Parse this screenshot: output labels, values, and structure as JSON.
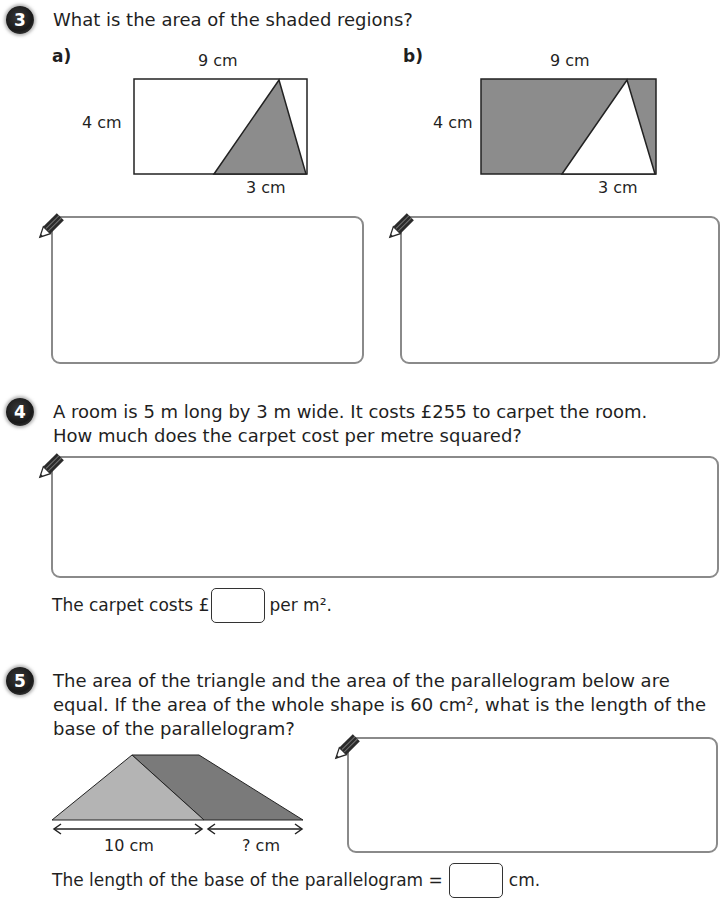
{
  "questions": [
    {
      "number": "3",
      "text": "What is the area of the shaded regions?",
      "parts": [
        {
          "label": "a)",
          "top_dim": "9 cm",
          "side_dim": "4 cm",
          "bottom_dim": "3 cm"
        },
        {
          "label": "b)",
          "top_dim": "9 cm",
          "side_dim": "4 cm",
          "bottom_dim": "3 cm"
        }
      ]
    },
    {
      "number": "4",
      "text_line1": "A room is 5 m long by 3 m wide. It costs £255 to carpet the room.",
      "text_line2": "How much does the carpet cost per metre squared?",
      "answer_prefix": "The carpet costs £",
      "answer_suffix": "per m².",
      "answer_value": ""
    },
    {
      "number": "5",
      "text_line1": "The area of the triangle and the area of the parallelogram below are",
      "text_line2": "equal. If the area of the whole shape is 60 cm², what is the length of the",
      "text_line3": "base of the parallelogram?",
      "triangle_base": "10 cm",
      "parallelogram_base": "? cm",
      "answer_prefix": "The length of the base of the parallelogram =",
      "answer_suffix": "cm.",
      "answer_value": ""
    }
  ],
  "colors": {
    "shade_dark": "#8c8c8c",
    "shade_light": "#b4b4b4",
    "shade_darker": "#7a7a7a",
    "box_border": "#8a8a8a"
  }
}
